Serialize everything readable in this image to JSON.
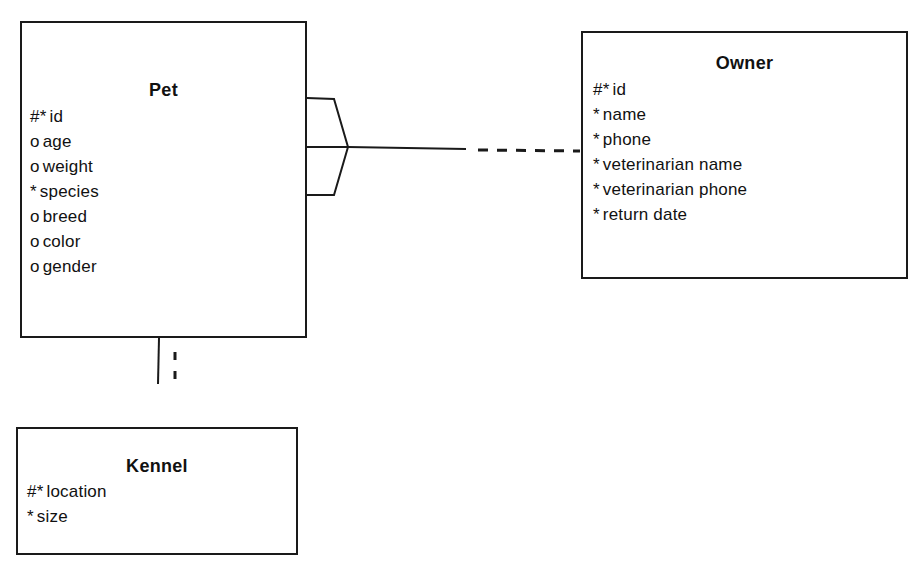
{
  "diagram": {
    "type": "Entity Relationship Diagram",
    "line_color": "#1a1a1a",
    "background": "#ffffff"
  },
  "entities": {
    "pet": {
      "title": "Pet",
      "attributes": [
        {
          "marker": "#*",
          "name": "id"
        },
        {
          "marker": "o",
          "name": "age"
        },
        {
          "marker": "o",
          "name": "weight"
        },
        {
          "marker": "*",
          "name": "species"
        },
        {
          "marker": "o",
          "name": "breed"
        },
        {
          "marker": "o",
          "name": "color"
        },
        {
          "marker": "o",
          "name": "gender"
        }
      ]
    },
    "owner": {
      "title": "Owner",
      "attributes": [
        {
          "marker": "#*",
          "name": "id"
        },
        {
          "marker": "*",
          "name": "name"
        },
        {
          "marker": "*",
          "name": "phone"
        },
        {
          "marker": "*",
          "name": "veterinarian name"
        },
        {
          "marker": "*",
          "name": "veterinarian phone"
        },
        {
          "marker": "*",
          "name": "return date"
        }
      ]
    },
    "kennel": {
      "title": "Kennel",
      "attributes": [
        {
          "marker": "#*",
          "name": "location"
        },
        {
          "marker": "*",
          "name": "size"
        }
      ]
    }
  },
  "relationships": [
    {
      "from": "Pet",
      "to": "Owner",
      "pet_end": "many (crow's foot), mandatory (solid)",
      "owner_end": "one, optional (dashed)"
    },
    {
      "from": "Pet",
      "to": "Kennel",
      "pet_end": "one, mandatory (solid)",
      "kennel_end": "one, optional (dashed)"
    }
  ]
}
